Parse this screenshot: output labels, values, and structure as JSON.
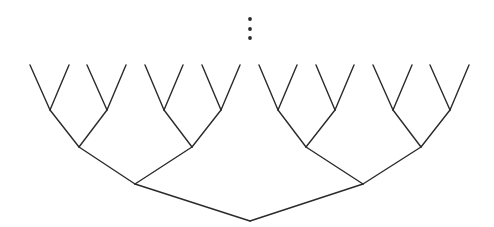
{
  "diagram": {
    "type": "binary-tree",
    "orientation": "root-bottom",
    "depth": 4,
    "leaf_count": 16,
    "continuation": "vertical-ellipsis",
    "colors": {
      "stroke": "#2a2a2a",
      "background": "#ffffff"
    },
    "stroke_width": 1.4,
    "ellipsis_dots": [
      {
        "x": 250,
        "y": 19
      },
      {
        "x": 250,
        "y": 29
      },
      {
        "x": 250,
        "y": 38
      }
    ],
    "levels": [
      {
        "name": "root",
        "y": 221,
        "x": [
          250
        ]
      },
      {
        "name": "level-1",
        "y": 184,
        "x": [
          135,
          363
        ]
      },
      {
        "name": "level-2",
        "y": 147,
        "x": [
          79,
          192,
          306,
          421
        ]
      },
      {
        "name": "level-3",
        "y": 110,
        "x": [
          50,
          107,
          164,
          221,
          278,
          335,
          393,
          450
        ]
      },
      {
        "name": "leaves",
        "y": 65,
        "x": [
          30,
          69,
          87,
          126,
          145,
          183,
          202,
          240,
          259,
          297,
          316,
          354,
          373,
          412,
          430,
          469
        ]
      }
    ]
  }
}
